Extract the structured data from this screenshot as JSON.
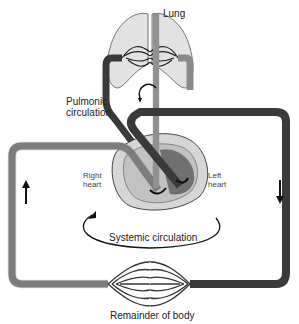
{
  "labels": {
    "lung": "Lung",
    "pulmonic_line1": "Pulmonic",
    "pulmonic_line2": "circulation",
    "right_heart_line1": "Right",
    "right_heart_line2": "heart",
    "left_heart_line1": "Left",
    "left_heart_line2": "heart",
    "systemic": "Systemic circulation",
    "body": "Remainder of body"
  },
  "colors": {
    "venous": "#8a8a8a",
    "arterial": "#3a3a3a",
    "lung_fill": "#e0e0e0",
    "heart_outer": "#d8d8d8",
    "heart_inner": "#b0b0b0",
    "outline": "#444444"
  },
  "arrows": {
    "left_side": "up",
    "right_side": "down"
  }
}
